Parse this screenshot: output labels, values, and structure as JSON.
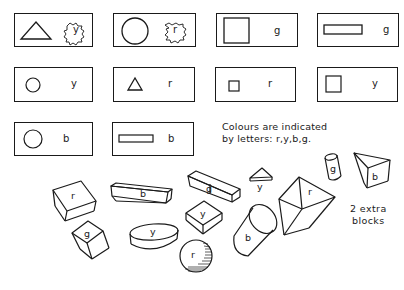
{
  "legend": {
    "caption_line1": "Colours are indicated",
    "caption_line2": "by letters: r,y,b,g.",
    "colour_letters": [
      "r",
      "y",
      "b",
      "g"
    ]
  },
  "cards": [
    {
      "shape": "large-triangle",
      "colour": "y",
      "label_style": "blob"
    },
    {
      "shape": "large-circle",
      "colour": "r",
      "label_style": "blob"
    },
    {
      "shape": "large-square",
      "colour": "g",
      "label_style": "plain"
    },
    {
      "shape": "long-rectangle",
      "colour": "g",
      "label_style": "plain"
    },
    {
      "shape": "small-circle",
      "colour": "y",
      "label_style": "plain"
    },
    {
      "shape": "small-triangle",
      "colour": "r",
      "label_style": "plain"
    },
    {
      "shape": "small-square",
      "colour": "r",
      "label_style": "plain"
    },
    {
      "shape": "medium-square",
      "colour": "y",
      "label_style": "plain"
    },
    {
      "shape": "medium-circle",
      "colour": "b",
      "label_style": "plain"
    },
    {
      "shape": "long-rectangle",
      "colour": "b",
      "label_style": "plain"
    }
  ],
  "blocks": [
    {
      "shape": "cuboid",
      "colour": "r"
    },
    {
      "shape": "long-bar",
      "colour": "b"
    },
    {
      "shape": "long-bar",
      "colour": "g"
    },
    {
      "shape": "small-triangular-prism",
      "colour": "y"
    },
    {
      "shape": "large-triangular-prism",
      "colour": "r"
    },
    {
      "shape": "small-cylinder",
      "colour": "g"
    },
    {
      "shape": "triangular-prism",
      "colour": "b"
    },
    {
      "shape": "cube",
      "colour": "g"
    },
    {
      "shape": "flat-disc",
      "colour": "y"
    },
    {
      "shape": "flat-cuboid",
      "colour": "y"
    },
    {
      "shape": "cylinder",
      "colour": "b"
    },
    {
      "shape": "sphere",
      "colour": "r"
    }
  ],
  "extra_note": {
    "line1": "2 extra",
    "line2": "blocks"
  }
}
